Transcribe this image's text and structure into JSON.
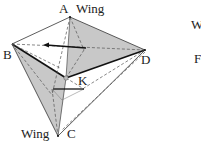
{
  "figure": {
    "labels": {
      "A": "A",
      "B": "B",
      "C": "C",
      "D": "D",
      "K": "K",
      "wing_top": "Wing",
      "wing_bottom": "Wing",
      "right_cut_1": "W",
      "right_cut_2": "F"
    },
    "vertices": {
      "A": [
        70,
        17
      ],
      "B": [
        12,
        44
      ],
      "C": [
        58,
        136
      ],
      "D": [
        145,
        50
      ],
      "center": [
        66,
        78
      ]
    },
    "colors": {
      "fill_shade": "#c8c8c8",
      "stroke": "#222222",
      "dashed": "#555555"
    }
  }
}
